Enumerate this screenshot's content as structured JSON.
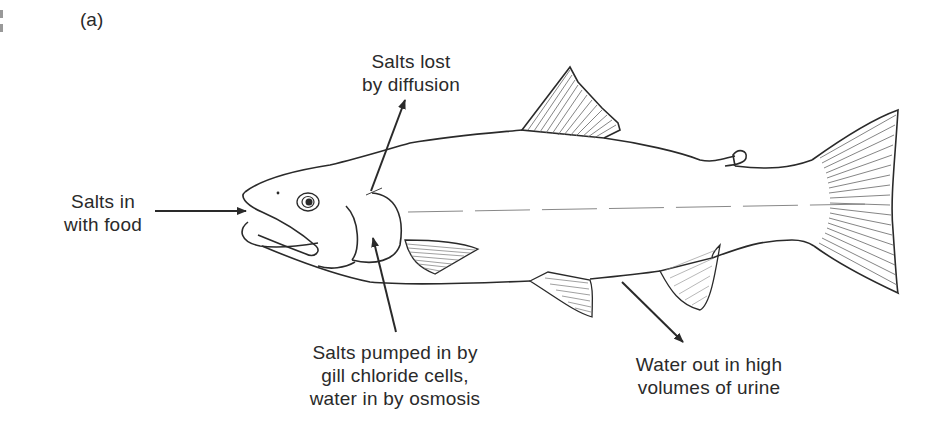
{
  "figure": {
    "panel_label": "(a)",
    "annotations": {
      "salts_lost": {
        "line1": "Salts lost",
        "line2": "by diffusion"
      },
      "salts_in_food": {
        "line1": "Salts in",
        "line2": "with food"
      },
      "salts_pumped": {
        "line1": "Salts pumped in by",
        "line2": "gill chloride cells,",
        "line3": "water in by osmosis"
      },
      "water_out": {
        "line1": "Water out in high",
        "line2": "volumes of urine"
      }
    }
  },
  "colors": {
    "line": "#2a2a2a",
    "fin_hatch": "#555555",
    "background": "#ffffff"
  }
}
